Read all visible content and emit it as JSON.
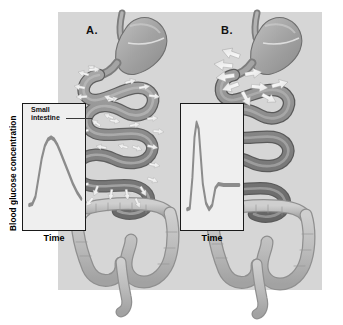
{
  "figure": {
    "background_color": "#d6d6d6",
    "panels": [
      {
        "letter": "A.",
        "name": "normal-absorption",
        "callout": "Small intestine",
        "graph": {
          "ylabel": "Blood glucose concentration",
          "xlabel": "Time",
          "box_color": "#efefef",
          "curve_color": "#8c8c8c"
        }
      },
      {
        "letter": "B.",
        "name": "rapid-gastric-emptying",
        "graph": {
          "ylabel": "Blood glucose concentration",
          "xlabel": "Time",
          "box_color": "#efefef",
          "curve_color": "#8c8c8c"
        }
      }
    ]
  },
  "colors": {
    "plate": "#d6d6d6",
    "graph_fill": "#efefef",
    "axis": "#1a1a1a",
    "curve": "#8c8c8c",
    "intestine_mid": "#8e8e8e",
    "intestine_dark": "#6f6f6f",
    "intestine_light": "#b4b4b4",
    "stomach": "#a8a8a8",
    "colon": "#bdbdbd",
    "arrow": "#ffffff",
    "arrow_edge": "#9a9a9a"
  },
  "chart_data": [
    {
      "type": "line",
      "name": "panel-a-glucose",
      "title": "",
      "xlabel": "Time",
      "ylabel": "Blood glucose concentration",
      "xlim": [
        0,
        100
      ],
      "ylim": [
        0,
        100
      ],
      "grid": false,
      "legend": "none",
      "annotation": "gradual broad rise and slow decline",
      "x": [
        0,
        6,
        12,
        18,
        24,
        30,
        36,
        42,
        48,
        54,
        60,
        68,
        76,
        84,
        92,
        100
      ],
      "y": [
        14,
        15,
        22,
        40,
        58,
        70,
        76,
        78,
        76,
        71,
        64,
        54,
        44,
        34,
        26,
        20
      ]
    },
    {
      "type": "line",
      "name": "panel-b-glucose",
      "title": "",
      "xlabel": "Time",
      "ylabel": "Blood glucose concentration",
      "xlim": [
        0,
        100
      ],
      "ylim": [
        0,
        100
      ],
      "grid": false,
      "legend": "none",
      "annotation": "sharp tall spike, rapid fall below baseline, small rebound",
      "x": [
        0,
        5,
        10,
        14,
        18,
        22,
        26,
        30,
        36,
        42,
        48,
        54,
        60,
        70,
        82,
        94,
        100
      ],
      "y": [
        10,
        11,
        40,
        78,
        92,
        86,
        60,
        34,
        16,
        10,
        14,
        30,
        34,
        33,
        33,
        33,
        33
      ]
    }
  ],
  "arrows": {
    "panel_a_label": "absorption arrows distributed along entire small intestine",
    "panel_a_count": 30,
    "panel_b_label": "large absorption arrows clustered at duodenum only",
    "panel_b_count": 9
  }
}
